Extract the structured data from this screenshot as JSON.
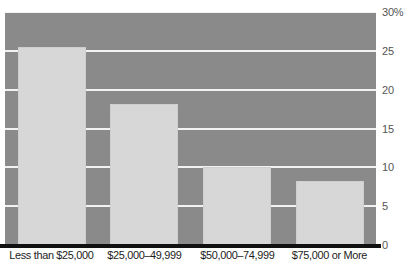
{
  "chart_data": {
    "type": "bar",
    "title": "",
    "subtitle": "",
    "xlabel": "",
    "ylabel": "",
    "categories": [
      "Less than $25,000",
      "$25,000–49,999",
      "$50,000–74,999",
      "$75,000 or More"
    ],
    "values": [
      25.5,
      18.2,
      10.0,
      8.3
    ],
    "series": [
      {
        "name": "Percent",
        "values": [
          25.5,
          18.2,
          10.0,
          8.3
        ]
      }
    ],
    "ylim": [
      0,
      30
    ],
    "ytick_values": [
      0,
      5,
      10,
      15,
      20,
      25,
      30
    ],
    "ytick_labels": [
      "0",
      "5",
      "10",
      "15",
      "20",
      "25",
      "30%"
    ],
    "grid": true,
    "grid_axis": "y",
    "legend": false,
    "legend_position": "none",
    "annotations": [],
    "colors": {
      "plot_background": "#8a8a8a",
      "bar_fill": "#d7d7d7",
      "gridline": "#f2f2f2",
      "axis_line": "#111111",
      "tick_label": "#555555",
      "category_label": "#1c1c1c",
      "page_background": "#ffffff"
    }
  }
}
